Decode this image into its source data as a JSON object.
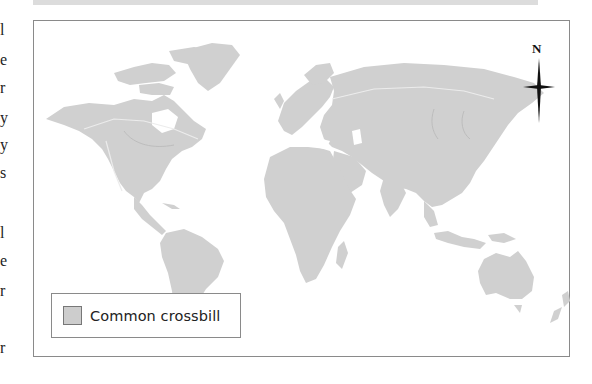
{
  "margin_fragments": [
    "l",
    "e",
    "r",
    "y",
    "y",
    "s",
    "l",
    "e",
    "r",
    "r"
  ],
  "map": {
    "land_color": "#d0d0d0",
    "range_color": "#c4c4c4",
    "ocean_color": "#ffffff",
    "border_color": "#8a8a8a"
  },
  "compass": {
    "label": "N"
  },
  "legend": {
    "items": [
      {
        "label": "Common crossbill",
        "swatch_color": "#cdcdcd"
      }
    ]
  }
}
